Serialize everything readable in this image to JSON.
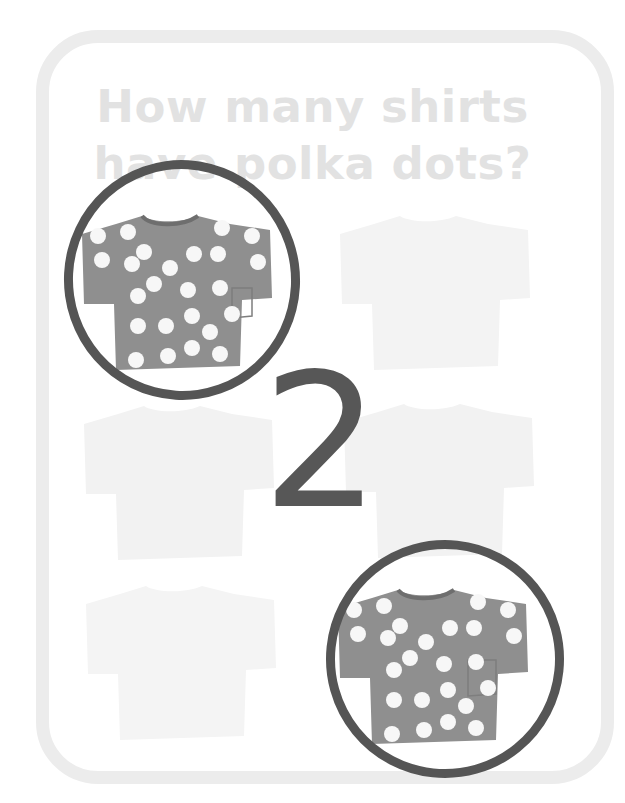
{
  "question": {
    "line1": "How many shirts",
    "line2": "have polka dots?"
  },
  "answer": "2",
  "colors": {
    "frame": "#ececec",
    "question_text": "#e2e2e2",
    "answer_text": "#575757",
    "circle": "#555555",
    "shirt_dotted": "#8f8f8f",
    "shirt_faded": "#f3f3f3",
    "dots": "#f7f7f7"
  },
  "shirts": [
    {
      "position": "top-left",
      "pattern": "polka-dots",
      "circled": true
    },
    {
      "position": "top-right",
      "pattern": "plain",
      "circled": false
    },
    {
      "position": "middle-left",
      "pattern": "plain",
      "circled": false
    },
    {
      "position": "middle-right",
      "pattern": "plain",
      "circled": false
    },
    {
      "position": "bottom-left",
      "pattern": "plain",
      "circled": false
    },
    {
      "position": "bottom-right",
      "pattern": "polka-dots",
      "circled": true
    }
  ]
}
